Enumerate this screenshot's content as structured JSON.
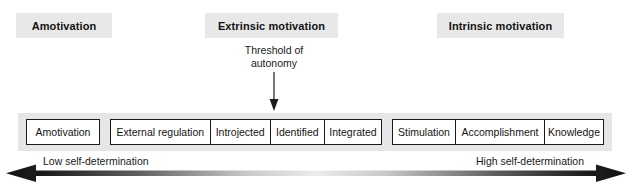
{
  "diagram": {
    "categories": [
      {
        "id": "amotivation",
        "label": "Amotivation"
      },
      {
        "id": "extrinsic",
        "label": "Extrinsic motivation"
      },
      {
        "id": "intrinsic",
        "label": "Intrinsic motivation"
      }
    ],
    "threshold": {
      "line1": "Threshold of",
      "line2": "autonomy",
      "arrow_direction": "down"
    },
    "groups": [
      {
        "id": "amotivation",
        "boxes": [
          {
            "label": "Amotivation"
          }
        ]
      },
      {
        "id": "extrinsic",
        "boxes": [
          {
            "label": "External regulation"
          },
          {
            "label": "Introjected"
          },
          {
            "label": "Identified"
          },
          {
            "label": "Integrated"
          }
        ]
      },
      {
        "id": "intrinsic",
        "boxes": [
          {
            "label": "Stimulation"
          },
          {
            "label": "Accomplishment"
          },
          {
            "label": "Knowledge"
          }
        ]
      }
    ],
    "axis": {
      "left_label": "Low self-determination",
      "right_label": "High self-determination",
      "arrow_type": "double-headed-gradient"
    },
    "colors": {
      "header_fill": "#e8e8e8",
      "band_fill": "#e6e6e6",
      "box_fill": "#ffffff",
      "stroke": "#1b1b1b",
      "text": "#131313",
      "page_background": "#ffffff"
    }
  }
}
